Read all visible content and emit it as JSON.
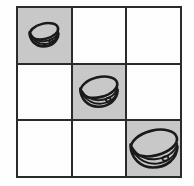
{
  "figure": {
    "type": "matrix-grid",
    "title": "",
    "rows": 3,
    "cols": 3,
    "background_color": "#ffffff",
    "line_color": "#2b2b2b",
    "shaded_cell_color": "#c9c9c9",
    "empty_cell_color": "#ffffff",
    "object_name": "bowl",
    "object_outline_color": "#1a1a1a"
  },
  "cells": [
    {
      "id": "cell-r1c1",
      "row": 1,
      "col": 1,
      "shaded": true,
      "shading_label": "gray",
      "has_object": true,
      "object": "bowl",
      "object_size": "small",
      "object_scale": 0.62
    },
    {
      "id": "cell-r1c2",
      "row": 1,
      "col": 2,
      "shaded": false,
      "shading_label": "white",
      "has_object": false,
      "object": "",
      "object_size": "",
      "object_scale": 0
    },
    {
      "id": "cell-r1c3",
      "row": 1,
      "col": 3,
      "shaded": false,
      "shading_label": "white",
      "has_object": false,
      "object": "",
      "object_size": "",
      "object_scale": 0
    },
    {
      "id": "cell-r2c1",
      "row": 2,
      "col": 1,
      "shaded": false,
      "shading_label": "white",
      "has_object": false,
      "object": "",
      "object_size": "",
      "object_scale": 0
    },
    {
      "id": "cell-r2c2",
      "row": 2,
      "col": 2,
      "shaded": true,
      "shading_label": "gray",
      "has_object": true,
      "object": "bowl",
      "object_size": "medium",
      "object_scale": 0.8
    },
    {
      "id": "cell-r2c3",
      "row": 2,
      "col": 3,
      "shaded": false,
      "shading_label": "white",
      "has_object": false,
      "object": "",
      "object_size": "",
      "object_scale": 0
    },
    {
      "id": "cell-r3c1",
      "row": 3,
      "col": 1,
      "shaded": false,
      "shading_label": "white",
      "has_object": false,
      "object": "",
      "object_size": "",
      "object_scale": 0
    },
    {
      "id": "cell-r3c2",
      "row": 3,
      "col": 2,
      "shaded": false,
      "shading_label": "white",
      "has_object": false,
      "object": "",
      "object_size": "",
      "object_scale": 0
    },
    {
      "id": "cell-r3c3",
      "row": 3,
      "col": 3,
      "shaded": true,
      "shading_label": "gray",
      "has_object": true,
      "object": "bowl",
      "object_size": "large",
      "object_scale": 1.0
    }
  ]
}
